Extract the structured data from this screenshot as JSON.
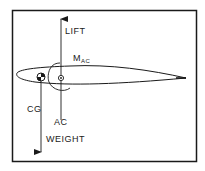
{
  "diagram": {
    "type": "airfoil-force-diagram",
    "labels": {
      "lift": "LIFT",
      "moment_main": "M",
      "moment_sub": "AC",
      "cg": "CG",
      "ac": "AC",
      "weight": "WEIGHT"
    },
    "colors": {
      "stroke": "#1a1a1a",
      "background": "#ffffff"
    }
  }
}
